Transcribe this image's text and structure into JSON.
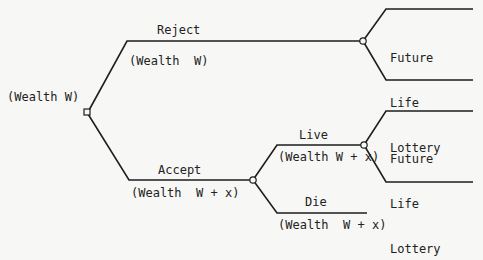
{
  "diagram": {
    "type": "decision-tree",
    "root": {
      "label": "(Wealth W)",
      "node_type": "decision"
    },
    "branches": {
      "reject": {
        "label": "Reject",
        "wealth": "(Wealth  W)",
        "outcome": {
          "node_type": "chance",
          "lines": [
            "Future",
            "Life",
            "Lottery"
          ]
        }
      },
      "accept": {
        "label": "Accept",
        "wealth": "(Wealth  W + x)",
        "node_type": "chance",
        "live": {
          "label": "Live",
          "wealth": "(Wealth W + x)",
          "outcome": {
            "node_type": "chance",
            "lines": [
              "Future",
              "Life",
              "Lottery"
            ]
          }
        },
        "die": {
          "label": "Die",
          "wealth": "(Wealth  W + x)"
        }
      }
    }
  }
}
